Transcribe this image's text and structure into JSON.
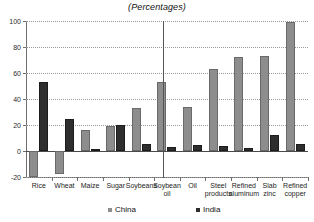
{
  "chart_data": {
    "type": "bar",
    "title": "(Percentages)",
    "xlabel": "",
    "ylabel": "",
    "ylim": [
      -20,
      100
    ],
    "yticks": [
      -20,
      0,
      20,
      40,
      60,
      80,
      100
    ],
    "ytick_labels": [
      "-20",
      "0",
      "20",
      "40",
      "60",
      "80",
      "100"
    ],
    "grid": true,
    "legend_position": "bottom",
    "categories": [
      "Rice",
      "Wheat",
      "Maize",
      "Sugar",
      "Soybeans",
      "Soybean\noil",
      "Oil",
      "Steel\nproducts",
      "Refined\naluminum",
      "Slab\nzinc",
      "Refined\ncopper"
    ],
    "series": [
      {
        "name": "China",
        "color": "#8d8d8d",
        "values": [
          -20,
          -18,
          16.5,
          19,
          33,
          53,
          34,
          63,
          72,
          73,
          99
        ]
      },
      {
        "name": "India",
        "color": "#2e2e2e",
        "values": [
          53,
          24.5,
          1.5,
          20,
          5.5,
          3,
          4.5,
          4,
          2,
          12.5,
          5.5
        ]
      }
    ],
    "annotations": [
      {
        "name": "group-divider",
        "type": "vertical-line",
        "between": [
          "Soybean\noil",
          "Oil"
        ]
      }
    ]
  },
  "legend": {
    "entries": [
      {
        "label": "China",
        "swatch": "china"
      },
      {
        "label": "India",
        "swatch": "india"
      }
    ]
  }
}
